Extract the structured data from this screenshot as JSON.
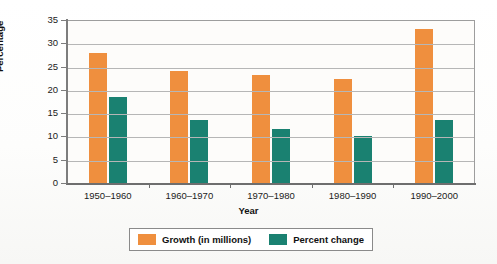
{
  "chart_data": {
    "type": "bar",
    "title": "",
    "xlabel": "Year",
    "ylabel": "Percentage",
    "categories": [
      "1950–1960",
      "1960–1970",
      "1970–1980",
      "1980–1990",
      "1990–2000"
    ],
    "series": [
      {
        "name": "Growth (in millions)",
        "color": "#ef8f3e",
        "values": [
          28,
          24,
          23.3,
          22.3,
          33
        ]
      },
      {
        "name": "Percent change",
        "color": "#1a8171",
        "values": [
          18.5,
          13.5,
          11.7,
          10.1,
          13.6
        ]
      }
    ],
    "ylim": [
      0,
      35
    ],
    "yticks": [
      0,
      5,
      10,
      15,
      20,
      25,
      30,
      35
    ],
    "ytick_labels": [
      "0",
      "5",
      "10",
      "15",
      "20",
      "25",
      "30",
      "35"
    ],
    "grid": true,
    "legend_position": "bottom"
  },
  "legend": {
    "items": [
      {
        "label": "Growth (in millions)",
        "swatch": "orange-swatch"
      },
      {
        "label": "Percent change",
        "swatch": "teal-swatch"
      }
    ]
  }
}
